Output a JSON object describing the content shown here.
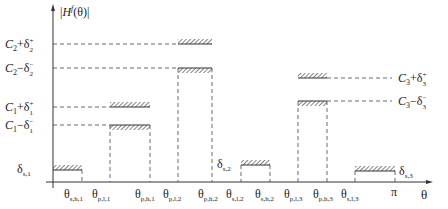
{
  "diagram": {
    "type": "filter-specification-tolerance-scheme",
    "y_axis_label": "|H^f(θ)|",
    "x_axis_label": "θ",
    "x_ticks": [
      {
        "id": "s_h_1",
        "main": "θ",
        "sub": "s,h,1",
        "x": 82
      },
      {
        "id": "p_l_1",
        "main": "θ",
        "sub": "p,l,1",
        "x": 110
      },
      {
        "id": "p_h_1",
        "main": "θ",
        "sub": "p,h,1",
        "x": 150
      },
      {
        "id": "p_l_2",
        "main": "θ",
        "sub": "p,l,2",
        "x": 178
      },
      {
        "id": "p_h_2",
        "main": "θ",
        "sub": "p,h,2",
        "x": 212
      },
      {
        "id": "s_l_2",
        "main": "θ",
        "sub": "s,l,2",
        "x": 241
      },
      {
        "id": "s_h_2",
        "main": "θ",
        "sub": "s,h,2",
        "x": 270
      },
      {
        "id": "p_l_3",
        "main": "θ",
        "sub": "p,l,3",
        "x": 298
      },
      {
        "id": "p_h_3",
        "main": "θ",
        "sub": "p,h,3",
        "x": 327
      },
      {
        "id": "s_l_3",
        "main": "θ",
        "sub": "s,l,3",
        "x": 355
      },
      {
        "id": "pi",
        "main": "π",
        "sub": "",
        "x": 395
      }
    ],
    "left_levels": [
      {
        "id": "c2_plus",
        "label": "C",
        "sub": "2",
        "op": "+δ",
        "sup": "+",
        "sub2": "2",
        "y": 44
      },
      {
        "id": "c2_minus",
        "label": "C",
        "sub": "2",
        "op": "−δ",
        "sup": "−",
        "sub2": "2",
        "y": 68
      },
      {
        "id": "c1_plus",
        "label": "C",
        "sub": "1",
        "op": "+δ",
        "sup": "+",
        "sub2": "1",
        "y": 107
      },
      {
        "id": "c1_minus",
        "label": "C",
        "sub": "1",
        "op": "−δ",
        "sup": "−",
        "sub2": "1",
        "y": 125
      }
    ],
    "right_levels": [
      {
        "id": "c3_plus",
        "label": "C",
        "sub": "3",
        "op": "+δ",
        "sup": "+",
        "sub2": "3",
        "y": 78
      },
      {
        "id": "c3_minus",
        "label": "C",
        "sub": "3",
        "op": "−δ",
        "sup": "−",
        "sub2": "3",
        "y": 101
      }
    ],
    "stopband_labels": [
      {
        "id": "ds1",
        "main": "δ",
        "sub": "s,1"
      },
      {
        "id": "ds2",
        "main": "δ",
        "sub": "s,2"
      },
      {
        "id": "ds3",
        "main": "δ",
        "sub": "s,3"
      }
    ],
    "bands": [
      {
        "kind": "stopband",
        "from": "0",
        "to": "θ_s,h,1",
        "level": "δ_s,1"
      },
      {
        "kind": "passband",
        "from": "θ_p,l,1",
        "to": "θ_p,h,1",
        "upper": "C1+δ1+",
        "lower": "C1−δ1−"
      },
      {
        "kind": "passband",
        "from": "θ_p,l,2",
        "to": "θ_p,h,2",
        "upper": "C2+δ2+",
        "lower": "C2−δ2−"
      },
      {
        "kind": "stopband",
        "from": "θ_s,l,2",
        "to": "θ_s,h,2",
        "level": "δ_s,2"
      },
      {
        "kind": "passband",
        "from": "θ_p,l,3",
        "to": "θ_p,h,3",
        "upper": "C3+δ3+",
        "lower": "C3−δ3−"
      },
      {
        "kind": "stopband",
        "from": "θ_s,l,3",
        "to": "π",
        "level": "δ_s,3"
      }
    ]
  }
}
